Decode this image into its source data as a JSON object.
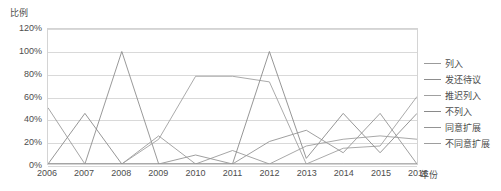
{
  "chart_data": {
    "type": "line",
    "title": "",
    "ylabel": "比例",
    "xlabel": "年份",
    "grid": true,
    "legend_position": "right",
    "ylim": [
      0,
      120
    ],
    "ytick_labels": [
      "0%",
      "20%",
      "40%",
      "60%",
      "80%",
      "100%",
      "120%"
    ],
    "ytick_values": [
      0,
      20,
      40,
      60,
      80,
      100,
      120
    ],
    "categories": [
      "2006",
      "2007",
      "2008",
      "2009",
      "2010",
      "2011",
      "2012",
      "2013",
      "2014",
      "2015",
      "2016"
    ],
    "series": [
      {
        "name": "列入",
        "color": "#9b9b9b",
        "values": [
          50,
          0,
          0,
          25,
          0,
          12,
          0,
          0,
          0,
          0,
          0
        ]
      },
      {
        "name": "发还待议",
        "color": "#8d8d8d",
        "values": [
          0,
          0,
          100,
          0,
          0,
          0,
          0,
          0,
          0,
          0,
          0
        ]
      },
      {
        "name": "推迟列入",
        "color": "#a0a0a0",
        "values": [
          0,
          0,
          0,
          22,
          78,
          78,
          73,
          0,
          14,
          16,
          60
        ]
      },
      {
        "name": "不列入",
        "color": "#8a8a8a",
        "values": [
          0,
          45,
          0,
          0,
          0,
          0,
          100,
          5,
          45,
          10,
          45
        ]
      },
      {
        "name": "同意扩展",
        "color": "#949494",
        "values": [
          0,
          0,
          0,
          0,
          8,
          0,
          20,
          30,
          10,
          45,
          0
        ]
      },
      {
        "name": "不同意扩展",
        "color": "#9e9e9e",
        "values": [
          0,
          0,
          0,
          0,
          0,
          0,
          0,
          16,
          22,
          25,
          22
        ]
      }
    ]
  }
}
